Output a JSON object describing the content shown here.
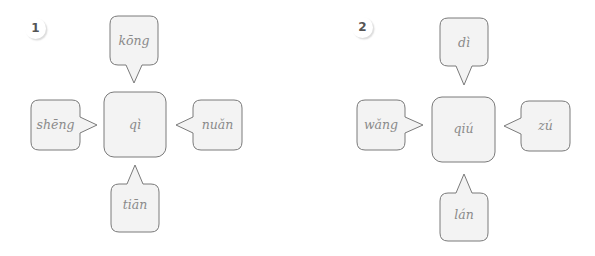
{
  "exercises": [
    {
      "number": "1",
      "center": "qì",
      "top": "kōng",
      "left": "shēng",
      "right": "nuǎn",
      "bottom": "tiān"
    },
    {
      "number": "2",
      "center": "qiú",
      "top": "dì",
      "left": "wǎng",
      "right": "zú",
      "bottom": "lán"
    }
  ],
  "colors": {
    "box_fill": "#f3f3f3",
    "box_stroke": "#7a7a7a",
    "text": "#8a8a8a"
  }
}
